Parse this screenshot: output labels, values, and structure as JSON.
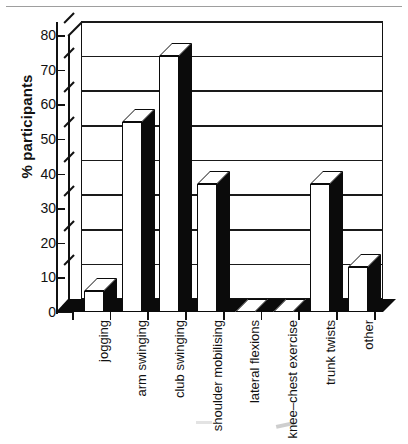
{
  "chart_data": {
    "type": "bar",
    "title": "",
    "xlabel": "",
    "ylabel": "% participants",
    "ylim": [
      0,
      80
    ],
    "yticks": [
      0,
      10,
      20,
      30,
      40,
      50,
      60,
      70,
      80
    ],
    "grid": true,
    "legend": "none",
    "style": "3d-bar scanned figure, white front faces with black side faces",
    "categories": [
      "jogging",
      "arm swinging",
      "club swinging",
      "shoulder mobilising",
      "lateral flexions",
      "knee–chest exercise",
      "trunk twists",
      "other"
    ],
    "values": [
      6,
      55,
      74,
      37,
      0,
      0,
      37,
      13
    ],
    "series": [
      {
        "name": "% participants",
        "values": [
          6,
          55,
          74,
          37,
          0,
          0,
          37,
          13
        ]
      }
    ]
  },
  "axes": {
    "y_title": "% participants",
    "tick_labels": [
      "80",
      "70",
      "60",
      "50",
      "40",
      "30",
      "20",
      "10",
      "0"
    ]
  },
  "categories": [
    {
      "label": "jogging",
      "value": 6
    },
    {
      "label": "arm swinging",
      "value": 55
    },
    {
      "label": "club swinging",
      "value": 74
    },
    {
      "label": "shoulder mobilising",
      "value": 37
    },
    {
      "label": "lateral flexions",
      "value": 0
    },
    {
      "label": "knee–chest exercise",
      "value": 0
    },
    {
      "label": "trunk twists",
      "value": 37
    },
    {
      "label": "other",
      "value": 13
    }
  ],
  "colors": {
    "ink": "#0b0b0b",
    "paper": "#ffffff",
    "bar_front": "#ffffff",
    "bar_side": "#0b0b0b",
    "grid": "#1a1a1a"
  }
}
